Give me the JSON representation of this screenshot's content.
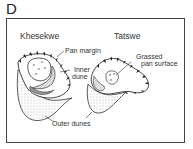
{
  "panel": {
    "letter": "D"
  },
  "diagram": {
    "sites": [
      {
        "name": "Khesekwe"
      },
      {
        "name": "Tatswe"
      }
    ],
    "labels": {
      "pan_margin": "Pan margin",
      "inner_dune_line1": "Inner",
      "inner_dune_line2": "dune",
      "grassed_line1": "Grassed",
      "grassed_line2": "pan surface",
      "outer_dunes": "Outer dunes"
    },
    "colors": {
      "line": "#333333",
      "frame": "#444444",
      "stipple": "#777777",
      "hatch_fill": "#9a9a9a"
    }
  }
}
